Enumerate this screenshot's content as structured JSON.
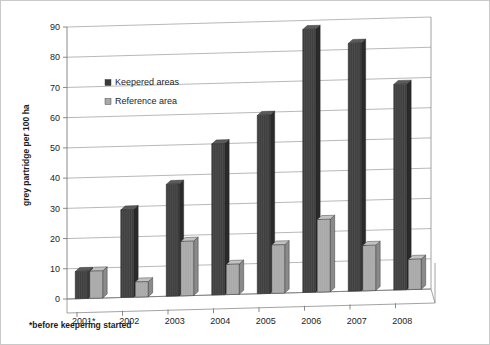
{
  "chart_data": {
    "type": "bar",
    "title": "",
    "subtitle": "",
    "xlabel": "",
    "ylabel": "grey partridge per 100 ha",
    "ylim": [
      0,
      90
    ],
    "ytick_step": 10,
    "yticks": [
      "0",
      "10",
      "20",
      "30",
      "40",
      "50",
      "60",
      "70",
      "80",
      "90"
    ],
    "grid": true,
    "legend_position": "upper-left-inside",
    "categories": [
      "2001*",
      "2002",
      "2003",
      "2004",
      "2005",
      "2006",
      "2007",
      "2008"
    ],
    "series": [
      {
        "name": "Keepered areas",
        "color": "#3a3a3a",
        "values": [
          9,
          29,
          37,
          50,
          59,
          87,
          82,
          68
        ]
      },
      {
        "name": "Reference area",
        "color": "#a8a8a8",
        "values": [
          9,
          5,
          18,
          10,
          16,
          24,
          15,
          10
        ]
      }
    ],
    "annotations": [
      {
        "name": "footnote",
        "text": "*before keepering started"
      }
    ]
  },
  "legend": {
    "items": [
      {
        "label": "Keepered areas",
        "swatch": "#3a3a3a"
      },
      {
        "label": "Reference area",
        "swatch": "#a8a8a8"
      }
    ]
  },
  "colors": {
    "keepered_front": "#3f3f3f",
    "keepered_side": "#2a2a2a",
    "keepered_top": "#5a5a5a",
    "reference_front": "#a9a9a9",
    "reference_side": "#8a8a8a",
    "reference_top": "#c2c2c2",
    "gridline": "#9a9a9a",
    "axis": "#7d7d7d",
    "text": "#1c1c1c",
    "background": "#ffffff"
  }
}
